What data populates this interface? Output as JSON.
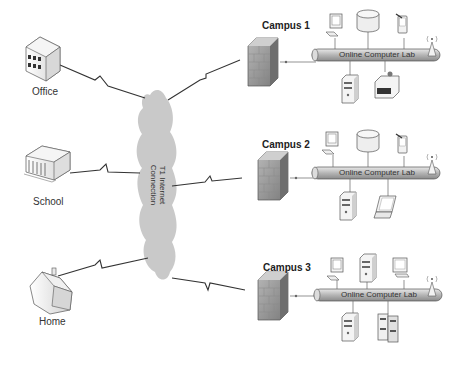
{
  "diagram": {
    "sites": [
      {
        "label": "Office"
      },
      {
        "label": "School"
      },
      {
        "label": "Home"
      }
    ],
    "cloud": {
      "line1": "T1 Internet",
      "line2": "Connection"
    },
    "campuses": [
      {
        "label": "Campus 1",
        "bus_label": "Online Computer Lab",
        "devices_top": [
          "desktop-computer",
          "database",
          "pda"
        ],
        "devices_bottom": [
          "tower-server",
          "printer"
        ]
      },
      {
        "label": "Campus 2",
        "bus_label": "Online Computer Lab",
        "devices_top": [
          "desktop-computer",
          "database",
          "pda"
        ],
        "devices_bottom": [
          "tower-server",
          "laptop"
        ]
      },
      {
        "label": "Campus 3",
        "bus_label": "Online Computer Lab",
        "devices_top": [
          "desktop-computer",
          "tower-server",
          "monitor"
        ],
        "devices_bottom": [
          "tower-server-with-storage",
          "server-rack"
        ]
      }
    ],
    "colors": {
      "line": "#333333",
      "cloud": "#c8c8c8",
      "bus": "#bdbdbd",
      "firewall": "#9a9a9a"
    }
  }
}
